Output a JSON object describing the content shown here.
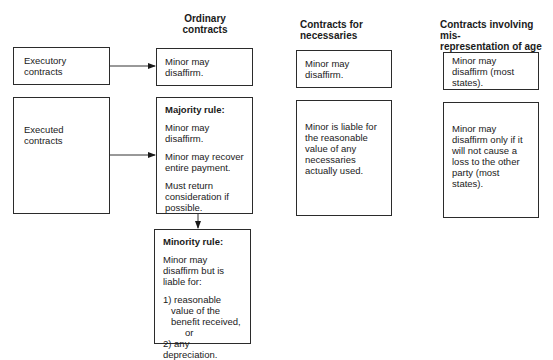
{
  "columns": {
    "ordinary": "Ordinary\ncontracts",
    "necessaries": "Contracts for\nnecessaries",
    "misrep": "Contracts involving mis-\nrepresentation of age"
  },
  "rows": {
    "executory": "Executory contracts",
    "executed": "Executed\ncontracts"
  },
  "ordinary": {
    "executory": "Minor may disaffirm.",
    "majority": {
      "title": "Majority rule:",
      "lines": [
        "Minor may disaffirm.",
        "Minor may recover entire payment.",
        "Must return consideration if possible."
      ]
    },
    "minority": {
      "title": "Minority rule:",
      "intro": "Minor may disaffirm but is liable for:",
      "item1": "1) reasonable value of the benefit received,",
      "or": "or",
      "item2": "2) any depreciation."
    }
  },
  "necessaries": {
    "executory": "Minor may disaffirm.",
    "executed": "Minor is liable for the reasonable value of any necessaries actually used."
  },
  "misrep": {
    "executory": "Minor may disaffirm (most states).",
    "executed": "Minor may disaffirm only if it will not cause a loss to the other party (most states)."
  }
}
